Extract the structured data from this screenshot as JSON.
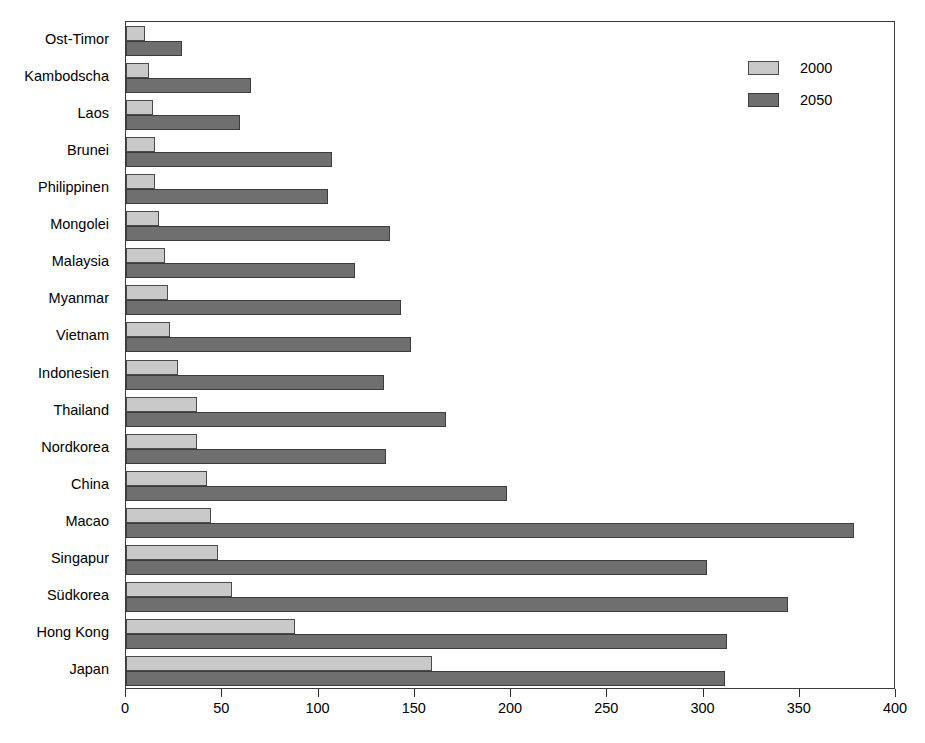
{
  "chart_data": {
    "type": "bar",
    "orientation": "horizontal",
    "title": "",
    "subtitle": "",
    "xlabel": "",
    "ylabel": "",
    "xlim": [
      0,
      400
    ],
    "xticks": [
      0,
      50,
      100,
      150,
      200,
      250,
      300,
      350,
      400
    ],
    "xtick_labels": [
      "0",
      "50",
      "100",
      "150",
      "200",
      "250",
      "300",
      "350",
      "400"
    ],
    "grid": false,
    "legend_position": "top-right",
    "categories": [
      "Ost-Timor",
      "Kambodscha",
      "Laos",
      "Brunei",
      "Philippinen",
      "Mongolei",
      "Malaysia",
      "Myanmar",
      "Vietnam",
      "Indonesien",
      "Thailand",
      "Nordkorea",
      "China",
      "Macao",
      "Singapur",
      "Südkorea",
      "Hong Kong",
      "Japan"
    ],
    "series": [
      {
        "name": "2000",
        "color": "#c9c9c9",
        "values": [
          10,
          12,
          14,
          15,
          15,
          17,
          20,
          22,
          23,
          27,
          37,
          37,
          42,
          44,
          48,
          55,
          88,
          159
        ]
      },
      {
        "name": "2050",
        "color": "#6f6f6f",
        "values": [
          29,
          65,
          59,
          107,
          105,
          137,
          119,
          143,
          148,
          134,
          166,
          135,
          198,
          378,
          302,
          344,
          312,
          311
        ]
      }
    ]
  },
  "legend": {
    "entries": [
      {
        "label": "2000"
      },
      {
        "label": "2050"
      }
    ]
  },
  "title_remnant": ""
}
